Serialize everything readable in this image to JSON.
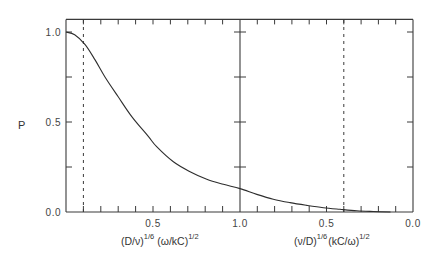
{
  "chart_data": {
    "type": "line",
    "title": "",
    "ylabel": "P",
    "ylim": [
      0,
      1.07
    ],
    "grid": false,
    "legend": "none",
    "y_ticks": [
      0.25,
      0.5,
      0.75,
      1.0
    ],
    "y_tick_labels": [
      {
        "value": 1.0,
        "label": "1.0"
      },
      {
        "value": 0.5,
        "label": "0.5"
      },
      {
        "value": 0.0,
        "label": "0.0"
      }
    ],
    "x_left": {
      "variable": "(D/ν)^(1/6) (ω/kC)^(1/2)",
      "label_parts": {
        "base1": "(D/ν)",
        "sup1": "1/6",
        "base2": "(ω/kC)",
        "sup2": "1/2"
      },
      "range": [
        0.0,
        1.0
      ],
      "tick_step": 0.1,
      "tick_labels": [
        {
          "value": 0.5,
          "label": "0.5"
        },
        {
          "value": 1.0,
          "label": "1.0"
        }
      ]
    },
    "x_right": {
      "variable": "(ν/D)^(1/6) (kC/ω)^(1/2)",
      "label_parts": {
        "base1": "(ν/D)",
        "sup1": "1/6",
        "base2": "(kC/ω)",
        "sup2": "1/2"
      },
      "range": [
        1.0,
        0.0
      ],
      "tick_step": 0.1,
      "tick_labels": [
        {
          "value": 0.5,
          "label": "0.5"
        },
        {
          "value": 0.0,
          "label": "0.0"
        }
      ]
    },
    "series": [
      {
        "name": "P",
        "left_points": [
          [
            0.0,
            1.0
          ],
          [
            0.05,
            0.985
          ],
          [
            0.11,
            0.93
          ],
          [
            0.167,
            0.845
          ],
          [
            0.224,
            0.75
          ],
          [
            0.3,
            0.64
          ],
          [
            0.378,
            0.53
          ],
          [
            0.473,
            0.42
          ],
          [
            0.521,
            0.363
          ],
          [
            0.617,
            0.279
          ],
          [
            0.713,
            0.224
          ],
          [
            0.809,
            0.182
          ],
          [
            0.904,
            0.154
          ],
          [
            1.0,
            0.13
          ]
        ],
        "right_points": [
          [
            1.0,
            0.13
          ],
          [
            0.903,
            0.098
          ],
          [
            0.808,
            0.071
          ],
          [
            0.711,
            0.052
          ],
          [
            0.614,
            0.037
          ],
          [
            0.518,
            0.024
          ],
          [
            0.422,
            0.015
          ],
          [
            0.325,
            0.007
          ],
          [
            0.229,
            0.003
          ],
          [
            0.13,
            0.0
          ]
        ]
      }
    ],
    "reference_lines": [
      {
        "axis": "left",
        "x": 0.1,
        "style": "dashed"
      },
      {
        "axis": "right",
        "x": 0.4,
        "style": "dashed"
      }
    ]
  }
}
